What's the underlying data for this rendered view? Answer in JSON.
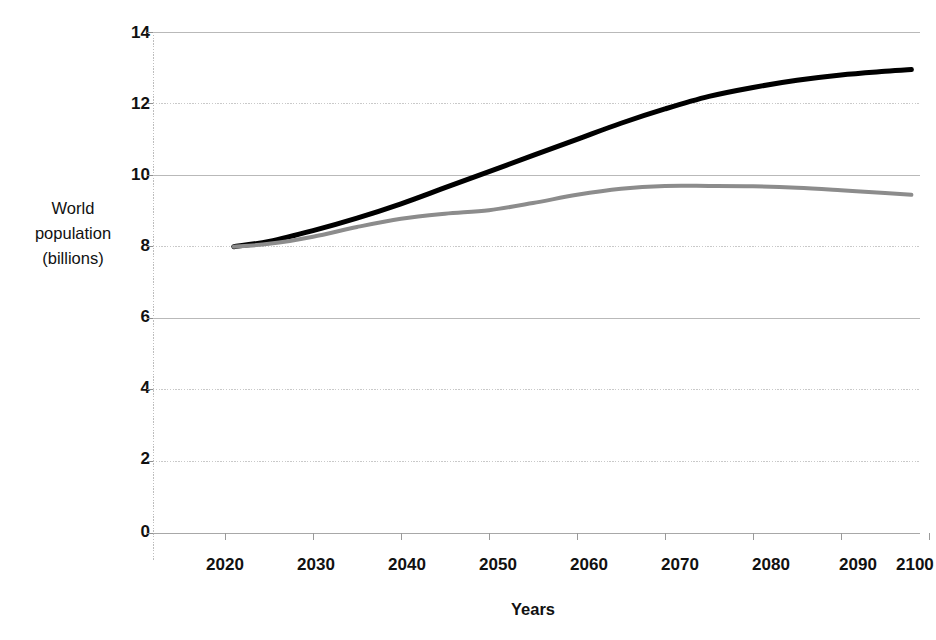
{
  "chart_data": {
    "type": "line",
    "title": "",
    "xlabel": "Years",
    "ylabel": "World population (billions)",
    "ylabel_lines": [
      "World",
      "population",
      "(billions)"
    ],
    "xlim": [
      2020,
      2100
    ],
    "ylim": [
      0,
      14
    ],
    "xticks": [
      2020,
      2030,
      2040,
      2050,
      2060,
      2070,
      2080,
      2090,
      2100
    ],
    "yticks": [
      0,
      2,
      4,
      6,
      8,
      10,
      12,
      14
    ],
    "xtick_labels": [
      "2020",
      "2030",
      "2040",
      "2050",
      "2060",
      "2070",
      "2080",
      "2090",
      "2100"
    ],
    "ytick_labels": [
      "0",
      "2",
      "4",
      "6",
      "8",
      "10",
      "12",
      "14"
    ],
    "grid": true,
    "grid_axis": "y",
    "legend": "none",
    "x": [
      2021,
      2025,
      2030,
      2035,
      2040,
      2045,
      2050,
      2055,
      2060,
      2065,
      2070,
      2075,
      2080,
      2085,
      2090,
      2095,
      2098
    ],
    "series": [
      {
        "name": "High projection",
        "color": "#000000",
        "width": 5,
        "values": [
          8.0,
          8.15,
          8.45,
          8.8,
          9.2,
          9.65,
          10.1,
          10.55,
          11.0,
          11.45,
          11.85,
          12.2,
          12.45,
          12.65,
          12.8,
          12.9,
          12.95
        ]
      },
      {
        "name": "Lower projection",
        "color": "#8c8c8c",
        "width": 4,
        "values": [
          8.0,
          8.08,
          8.28,
          8.55,
          8.78,
          8.92,
          9.02,
          9.22,
          9.45,
          9.62,
          9.7,
          9.7,
          9.69,
          9.65,
          9.58,
          9.5,
          9.45
        ]
      }
    ],
    "annotations": []
  },
  "axes": {
    "x_title": "Years",
    "y_title_lines": [
      "World",
      "population",
      "(billions)"
    ]
  }
}
